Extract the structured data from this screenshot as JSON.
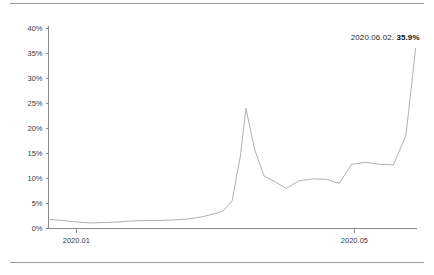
{
  "chart_data": {
    "type": "line",
    "title": "",
    "subtitle": "",
    "xlabel": "",
    "ylabel": "",
    "grid": false,
    "legend_position": "none",
    "ylim": [
      0,
      40
    ],
    "yticks": [
      0,
      5,
      10,
      15,
      20,
      25,
      30,
      35,
      40
    ],
    "ytick_labels": [
      "0%",
      "5%",
      "10%",
      "15%",
      "20%",
      "25%",
      "30%",
      "35%",
      "40%"
    ],
    "xtick_labels": [
      "2020.01",
      "2020.05"
    ],
    "xtick_positions": [
      1.0,
      5.0
    ],
    "xlim": [
      0.6,
      5.9
    ],
    "line_color": "#b0b0b0",
    "axis_color": "#8c8c8c",
    "x": [
      0.62,
      0.8,
      1.0,
      1.2,
      1.4,
      1.6,
      1.8,
      2.0,
      2.2,
      2.4,
      2.6,
      2.8,
      3.0,
      3.12,
      3.24,
      3.36,
      3.44,
      3.56,
      3.7,
      3.86,
      4.02,
      4.2,
      4.4,
      4.6,
      4.78,
      4.96,
      5.16,
      5.36,
      5.56,
      5.74,
      5.88
    ],
    "values": [
      1.8,
      1.6,
      1.3,
      1.1,
      1.2,
      1.3,
      1.5,
      1.6,
      1.6,
      1.7,
      1.9,
      2.3,
      3.0,
      3.6,
      5.5,
      14.5,
      24.0,
      16.0,
      10.5,
      9.3,
      8.0,
      9.5,
      9.9,
      9.8,
      9.0,
      12.8,
      13.2,
      12.8,
      12.7,
      18.5,
      35.9
    ],
    "annotations": [
      {
        "label_date": "2020.06.02.",
        "label_value": "35.9%",
        "x": 5.88,
        "y": 35.9
      }
    ]
  },
  "annotation": {
    "date_text": "2020.06.02. ",
    "value_text": "35.9%"
  },
  "colors": {
    "line": "#b0b0b0",
    "axis": "#8c8c8c",
    "rule": "#9a9a9a",
    "text": "#3b3b3b",
    "annotation_value": "#111111"
  }
}
